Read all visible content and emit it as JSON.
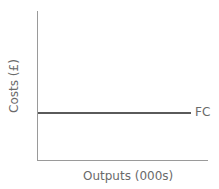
{
  "chart_data": {
    "type": "line",
    "title": "",
    "xlabel": "Outputs (000s)",
    "ylabel": "Costs (£)",
    "series": [
      {
        "name": "FC",
        "description": "Fixed costs - horizontal line constant across all output levels",
        "relative_level": 0.32
      }
    ],
    "grid": false,
    "ticks": false,
    "legend": "inline label at line end (right)"
  },
  "labels": {
    "x_axis": "Outputs (000s)",
    "y_axis": "Costs (£)",
    "fc": "FC"
  },
  "colors": {
    "axes": "#9a9a9a",
    "fc_line": "#5a5a5a",
    "text": "#6a6a6a"
  }
}
